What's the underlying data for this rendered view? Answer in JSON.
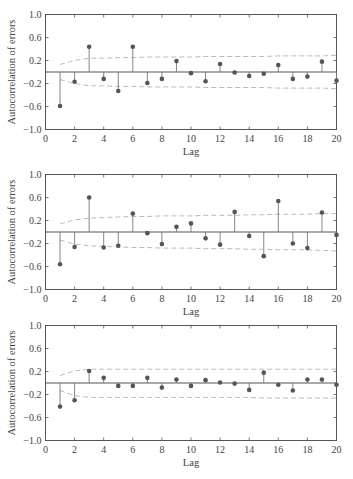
{
  "chart_data": [
    {
      "type": "stem",
      "title": "",
      "xlabel": "Lag",
      "ylabel": "Autocorrelation of errors",
      "xlim": [
        0,
        20
      ],
      "ylim": [
        -1.0,
        1.0
      ],
      "xticks": [
        "0",
        "2",
        "4",
        "6",
        "8",
        "10",
        "12",
        "14",
        "16",
        "18",
        "20"
      ],
      "yticks": [
        "1.0",
        "0.6",
        "0.2",
        "−0.2",
        "−0.6",
        "−1.0"
      ],
      "grid": false,
      "x": [
        1,
        2,
        3,
        4,
        5,
        6,
        7,
        8,
        9,
        10,
        11,
        12,
        13,
        14,
        15,
        16,
        17,
        18,
        19,
        20
      ],
      "values": [
        -0.59,
        -0.17,
        0.44,
        -0.12,
        -0.33,
        0.44,
        -0.19,
        -0.12,
        0.19,
        -0.02,
        -0.16,
        0.14,
        -0.01,
        -0.07,
        -0.03,
        0.12,
        -0.12,
        -0.08,
        0.18,
        -0.15
      ],
      "confidence_upper": [
        0.13,
        0.2,
        0.24,
        0.24,
        0.25,
        0.25,
        0.26,
        0.26,
        0.26,
        0.26,
        0.27,
        0.27,
        0.27,
        0.27,
        0.27,
        0.28,
        0.28,
        0.28,
        0.28,
        0.29
      ],
      "confidence_lower": [
        -0.13,
        -0.2,
        -0.24,
        -0.24,
        -0.25,
        -0.25,
        -0.26,
        -0.26,
        -0.26,
        -0.26,
        -0.27,
        -0.27,
        -0.27,
        -0.27,
        -0.27,
        -0.28,
        -0.28,
        -0.28,
        -0.28,
        -0.29
      ]
    },
    {
      "type": "stem",
      "title": "",
      "xlabel": "Lag",
      "ylabel": "Autocorrelation of errors",
      "xlim": [
        0,
        20
      ],
      "ylim": [
        -1.0,
        1.0
      ],
      "xticks": [
        "0",
        "2",
        "4",
        "6",
        "8",
        "10",
        "12",
        "14",
        "16",
        "18",
        "20"
      ],
      "yticks": [
        "1.0",
        "0.6",
        "0.2",
        "−0.2",
        "−0.6",
        "−1.0"
      ],
      "grid": false,
      "x": [
        1,
        2,
        3,
        4,
        5,
        6,
        7,
        8,
        9,
        10,
        11,
        12,
        13,
        14,
        15,
        16,
        17,
        18,
        19,
        20
      ],
      "values": [
        -0.56,
        -0.26,
        0.6,
        -0.27,
        -0.24,
        0.32,
        -0.02,
        -0.21,
        0.09,
        0.15,
        -0.11,
        -0.22,
        0.35,
        -0.07,
        -0.42,
        0.54,
        -0.2,
        -0.28,
        0.34,
        -0.05
      ],
      "confidence_upper": [
        0.14,
        0.21,
        0.24,
        0.25,
        0.26,
        0.27,
        0.27,
        0.28,
        0.28,
        0.28,
        0.29,
        0.29,
        0.29,
        0.3,
        0.3,
        0.31,
        0.31,
        0.31,
        0.32,
        0.32
      ],
      "confidence_lower": [
        -0.14,
        -0.21,
        -0.24,
        -0.25,
        -0.26,
        -0.27,
        -0.27,
        -0.28,
        -0.28,
        -0.28,
        -0.29,
        -0.29,
        -0.29,
        -0.3,
        -0.3,
        -0.31,
        -0.31,
        -0.31,
        -0.32,
        -0.33
      ]
    },
    {
      "type": "stem",
      "title": "",
      "xlabel": "Lag",
      "ylabel": "Autocorrelation of errors",
      "xlim": [
        0,
        20
      ],
      "ylim": [
        -1.0,
        1.0
      ],
      "xticks": [
        "0",
        "2",
        "4",
        "6",
        "8",
        "10",
        "12",
        "14",
        "16",
        "18",
        "20"
      ],
      "yticks": [
        "1.0",
        "0.6",
        "0.2",
        "−0.2",
        "−0.6",
        "−1.0"
      ],
      "grid": false,
      "x": [
        1,
        2,
        3,
        4,
        5,
        6,
        7,
        8,
        9,
        10,
        11,
        12,
        13,
        14,
        15,
        16,
        17,
        18,
        19,
        20
      ],
      "values": [
        -0.41,
        -0.3,
        0.21,
        0.09,
        -0.05,
        -0.05,
        0.09,
        -0.08,
        0.06,
        -0.05,
        0.05,
        0.01,
        -0.01,
        -0.12,
        0.18,
        -0.03,
        -0.13,
        0.06,
        0.06,
        -0.03
      ],
      "confidence_upper": [
        0.13,
        0.21,
        0.24,
        0.24,
        0.24,
        0.24,
        0.24,
        0.24,
        0.24,
        0.24,
        0.24,
        0.24,
        0.24,
        0.24,
        0.24,
        0.24,
        0.24,
        0.24,
        0.24,
        0.24
      ],
      "confidence_lower": [
        -0.13,
        -0.22,
        -0.25,
        -0.25,
        -0.25,
        -0.25,
        -0.25,
        -0.25,
        -0.25,
        -0.25,
        -0.25,
        -0.25,
        -0.25,
        -0.25,
        -0.26,
        -0.26,
        -0.26,
        -0.26,
        -0.26,
        -0.26
      ]
    }
  ],
  "style": {
    "axis_color": "#555555",
    "stem_color": "#777777",
    "marker_color": "#555555",
    "band_color": "#bbbbbb",
    "text_color": "#444444"
  }
}
